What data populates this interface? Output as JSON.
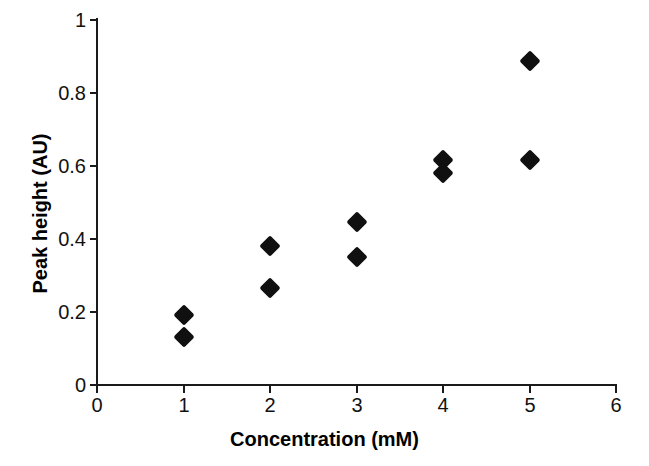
{
  "chart_data": {
    "type": "scatter",
    "title": "",
    "xlabel": "Concentration (mM)",
    "ylabel": "Peak height (AU)",
    "xlim": [
      0,
      6
    ],
    "ylim": [
      0,
      1
    ],
    "xticks": [
      "0",
      "1",
      "2",
      "3",
      "4",
      "5",
      "6"
    ],
    "xtick_values": [
      0,
      1,
      2,
      3,
      4,
      5,
      6
    ],
    "yticks": [
      "0",
      "0.2",
      "0.4",
      "0.6",
      "0.8",
      "1"
    ],
    "ytick_values": [
      0,
      0.2,
      0.4,
      0.6,
      0.8,
      1
    ],
    "grid": false,
    "legend": false,
    "marker": "filled-diamond",
    "marker_color": "#101010",
    "series": [
      {
        "name": "Peak height",
        "points": [
          {
            "x": 1,
            "y": 0.19
          },
          {
            "x": 1,
            "y": 0.13
          },
          {
            "x": 2,
            "y": 0.38
          },
          {
            "x": 2,
            "y": 0.265
          },
          {
            "x": 3,
            "y": 0.445
          },
          {
            "x": 3,
            "y": 0.35
          },
          {
            "x": 4,
            "y": 0.615
          },
          {
            "x": 4,
            "y": 0.58
          },
          {
            "x": 5,
            "y": 0.885
          },
          {
            "x": 5,
            "y": 0.615
          }
        ]
      }
    ]
  },
  "axes": {
    "x_title": "Concentration (mM)",
    "y_title": "Peak height (AU)",
    "x_tick_labels": [
      "0",
      "1",
      "2",
      "3",
      "4",
      "5",
      "6"
    ],
    "y_tick_labels": [
      "0",
      "0.2",
      "0.4",
      "0.6",
      "0.8",
      "1"
    ]
  },
  "colors": {
    "axis": "#1a1a1a",
    "marker": "#101010",
    "background": "#ffffff",
    "text": "#000000"
  }
}
